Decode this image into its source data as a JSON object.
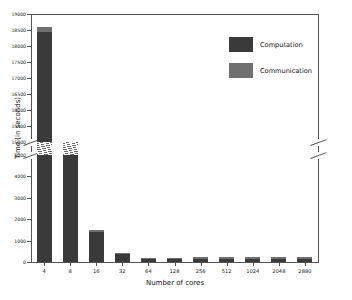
{
  "chart_data": {
    "type": "bar",
    "title": "",
    "xlabel": "Number of cores",
    "ylabel": "Time (in seconds)",
    "stacked": true,
    "grid": false,
    "legend_position": "upper right",
    "broken_axis": true,
    "y_axis_lower_range": [
      0,
      5000
    ],
    "y_axis_upper_range": [
      15000,
      19000
    ],
    "y_ticks_lower": [
      "0",
      "1000",
      "2000",
      "3000",
      "4000",
      "5000"
    ],
    "y_ticks_upper": [
      "15000",
      "15500",
      "16000",
      "16500",
      "17000",
      "17500",
      "18000",
      "18500",
      "19000"
    ],
    "categories": [
      "4",
      "8",
      "16",
      "32",
      "64",
      "128",
      "256",
      "512",
      "1024",
      "2048",
      "2880"
    ],
    "series": [
      {
        "name": "Computation",
        "color": "#3a3a3a",
        "values": [
          18450,
          5130,
          1430,
          400,
          150,
          130,
          150,
          150,
          150,
          150,
          150
        ]
      },
      {
        "name": "Communication",
        "color": "#707070",
        "values": [
          150,
          70,
          50,
          40,
          40,
          50,
          80,
          90,
          90,
          90,
          90
        ]
      }
    ],
    "totals": [
      18600,
      5200,
      1480,
      440,
      190,
      180,
      230,
      240,
      240,
      240,
      240
    ]
  },
  "legend": {
    "items": [
      {
        "label": "Computation"
      },
      {
        "label": "Communication"
      }
    ]
  }
}
